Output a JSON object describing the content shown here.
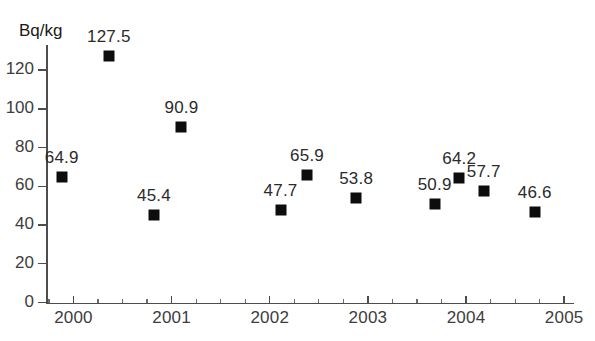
{
  "chart_data": {
    "type": "scatter",
    "title": "",
    "xlabel": "",
    "ylabel": "Bq/kg",
    "unit_label": "Bq/kg",
    "xlim": [
      1999.72,
      2005.1
    ],
    "ylim": [
      0,
      133
    ],
    "grid": false,
    "legend": null,
    "y_ticks": [
      0,
      20,
      40,
      60,
      80,
      100,
      120
    ],
    "y_tick_labels": [
      "0",
      "20",
      "40",
      "60",
      "80",
      "100",
      "120"
    ],
    "x_ticks": [
      2000,
      2001,
      2002,
      2003,
      2004,
      2005
    ],
    "x_tick_labels": [
      "2000",
      "2001",
      "2002",
      "2003",
      "2004",
      "2005"
    ],
    "x_minor_tick_step": 0.25,
    "marker": "filled-square",
    "marker_color": "#0d0d0d",
    "axis_color": "#4d4d4d",
    "points": [
      {
        "x": 1999.88,
        "y": 64.9,
        "label": "64.9"
      },
      {
        "x": 2000.36,
        "y": 127.5,
        "label": "127.5"
      },
      {
        "x": 2000.82,
        "y": 45.4,
        "label": "45.4"
      },
      {
        "x": 2001.1,
        "y": 90.9,
        "label": "90.9"
      },
      {
        "x": 2002.11,
        "y": 47.7,
        "label": "47.7"
      },
      {
        "x": 2002.38,
        "y": 65.9,
        "label": "65.9"
      },
      {
        "x": 2002.88,
        "y": 53.8,
        "label": "53.8"
      },
      {
        "x": 2003.68,
        "y": 50.9,
        "label": "50.9"
      },
      {
        "x": 2003.93,
        "y": 64.2,
        "label": "64.2"
      },
      {
        "x": 2004.18,
        "y": 57.7,
        "label": "57.7"
      },
      {
        "x": 2004.7,
        "y": 46.6,
        "label": "46.6"
      }
    ],
    "values": [
      64.9,
      127.5,
      45.4,
      90.9,
      47.7,
      65.9,
      53.8,
      50.9,
      64.2,
      57.7,
      46.6
    ]
  }
}
